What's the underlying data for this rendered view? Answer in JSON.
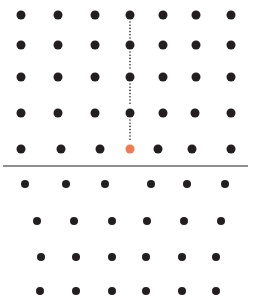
{
  "diagram": {
    "type": "crystal-lattice-edge-dislocation",
    "colors": {
      "atom": "#231f20",
      "highlight_atom": "#f47a50",
      "slip_plane": "#231f20",
      "extra_half_plane": "#231f20",
      "background": "#ffffff"
    },
    "atom_radius_top": 4.5,
    "atom_radius_bottom": 4,
    "upper_rows": [
      {
        "y": 15,
        "x": [
          21,
          58,
          95,
          130,
          163,
          196,
          231
        ]
      },
      {
        "y": 45,
        "x": [
          21,
          58,
          95,
          130,
          163,
          196,
          231
        ]
      },
      {
        "y": 77,
        "x": [
          21,
          58,
          95,
          130,
          163,
          196,
          231
        ]
      },
      {
        "y": 113,
        "x": [
          21,
          58,
          95,
          130,
          163,
          195,
          231
        ]
      },
      {
        "y": 149,
        "x": [
          21,
          61,
          100,
          130,
          158,
          192,
          231
        ]
      }
    ],
    "highlight_atom": {
      "x": 130,
      "y": 149
    },
    "slip_plane": {
      "x1": 3,
      "x2": 248,
      "y": 166
    },
    "lower_rows": [
      {
        "y": 184,
        "x": [
          25,
          66,
          105,
          151,
          187,
          225
        ]
      },
      {
        "y": 221,
        "x": [
          37,
          74,
          112,
          147,
          184,
          221
        ]
      },
      {
        "y": 257,
        "x": [
          41,
          76,
          112,
          146,
          182,
          216
        ]
      },
      {
        "y": 291,
        "x": [
          40,
          76,
          112,
          146,
          182,
          216
        ]
      }
    ],
    "extra_half_plane": {
      "x": 130,
      "y_start": 15,
      "y_end": 149,
      "style": "dotted"
    }
  }
}
